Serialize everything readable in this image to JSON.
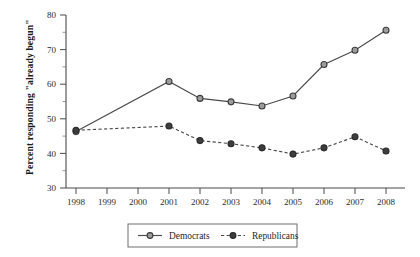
{
  "chart_data": {
    "type": "line",
    "title": "",
    "xlabel": "",
    "ylabel": "Percent responding \"already begun\"",
    "x": [
      1998,
      1999,
      2000,
      2001,
      2002,
      2003,
      2004,
      2005,
      2006,
      2007,
      2008
    ],
    "xtick_labels": [
      "1998",
      "1999",
      "2000",
      "2001",
      "2002",
      "2003",
      "2004",
      "2005",
      "2006",
      "2007",
      "2008"
    ],
    "ytick_labels": [
      "30",
      "40",
      "50",
      "60",
      "70",
      "80"
    ],
    "yticks": [
      30,
      40,
      50,
      60,
      70,
      80
    ],
    "ylim": [
      30,
      80
    ],
    "xlim": [
      1998,
      2008
    ],
    "grid": false,
    "minor_ticks": true,
    "legend_position": "bottom-center",
    "series": [
      {
        "name": "Democrats",
        "line_style": "solid",
        "marker": "open-circle",
        "marker_fill": "#9c9c9c",
        "color": "#4a4a4a",
        "points": [
          {
            "x": 1998,
            "y": 46.3
          },
          {
            "x": 2001,
            "y": 60.8
          },
          {
            "x": 2002,
            "y": 55.9
          },
          {
            "x": 2003,
            "y": 54.9
          },
          {
            "x": 2004,
            "y": 53.7
          },
          {
            "x": 2005,
            "y": 56.6
          },
          {
            "x": 2006,
            "y": 65.7
          },
          {
            "x": 2007,
            "y": 69.8
          },
          {
            "x": 2008,
            "y": 75.6
          }
        ],
        "values": [
          46.3,
          null,
          null,
          60.8,
          55.9,
          54.9,
          53.7,
          56.6,
          65.7,
          69.8,
          75.6
        ]
      },
      {
        "name": "Republicans",
        "line_style": "dashed",
        "marker": "filled-circle",
        "marker_fill": "#3d3d3d",
        "color": "#4a4a4a",
        "points": [
          {
            "x": 1998,
            "y": 46.7
          },
          {
            "x": 2001,
            "y": 47.9
          },
          {
            "x": 2002,
            "y": 43.7
          },
          {
            "x": 2003,
            "y": 42.8
          },
          {
            "x": 2004,
            "y": 41.6
          },
          {
            "x": 2005,
            "y": 39.8
          },
          {
            "x": 2006,
            "y": 41.6
          },
          {
            "x": 2007,
            "y": 44.8
          },
          {
            "x": 2008,
            "y": 40.7
          }
        ],
        "values": [
          46.7,
          null,
          null,
          47.9,
          43.7,
          42.8,
          41.6,
          39.8,
          41.6,
          44.8,
          40.7
        ]
      }
    ]
  },
  "legend": {
    "items": [
      {
        "label": "Democrats",
        "marker": "open-circle",
        "style": "solid"
      },
      {
        "label": "Republicans",
        "marker": "filled-circle",
        "style": "dashed"
      }
    ]
  },
  "colors": {
    "axis": "#4a4a4a",
    "text": "#1f1f1f",
    "dem_marker": "#9c9c9c",
    "rep_marker": "#3d3d3d",
    "background": "#ffffff"
  }
}
